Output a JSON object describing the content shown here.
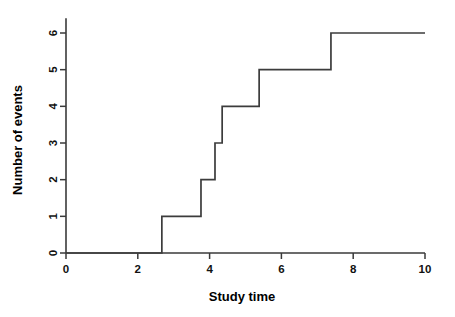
{
  "chart_data": {
    "type": "line",
    "subtype": "step",
    "title": "",
    "xlabel": "Study time",
    "ylabel": "Number of events",
    "xlim": [
      0,
      10
    ],
    "ylim": [
      0,
      6.4
    ],
    "xticks": [
      0,
      2,
      4,
      6,
      8,
      10
    ],
    "xtick_labels": [
      "0",
      "2",
      "4",
      "6",
      "8",
      "10"
    ],
    "yticks": [
      0,
      1,
      2,
      3,
      4,
      5,
      6
    ],
    "ytick_labels": [
      "0",
      "1",
      "2",
      "3",
      "4",
      "5",
      "6"
    ],
    "grid": false,
    "legend": null,
    "line_color": "#3c3c3c",
    "axis_color": "#3a3a3a",
    "background_color": "#ffffff",
    "event_times": [
      2.67,
      3.76,
      4.15,
      4.35,
      5.38,
      7.38
    ],
    "cumulative_counts": [
      1,
      2,
      3,
      4,
      5,
      6
    ],
    "step_points": [
      {
        "x": 0.0,
        "y": 0
      },
      {
        "x": 2.67,
        "y": 0
      },
      {
        "x": 2.67,
        "y": 1
      },
      {
        "x": 3.76,
        "y": 1
      },
      {
        "x": 3.76,
        "y": 2
      },
      {
        "x": 4.15,
        "y": 2
      },
      {
        "x": 4.15,
        "y": 3
      },
      {
        "x": 4.35,
        "y": 3
      },
      {
        "x": 4.35,
        "y": 4
      },
      {
        "x": 5.38,
        "y": 4
      },
      {
        "x": 5.38,
        "y": 5
      },
      {
        "x": 7.38,
        "y": 5
      },
      {
        "x": 7.38,
        "y": 6
      },
      {
        "x": 10.0,
        "y": 6
      }
    ]
  },
  "axes": {
    "x_title": "Study time",
    "y_title": "Number of events"
  }
}
